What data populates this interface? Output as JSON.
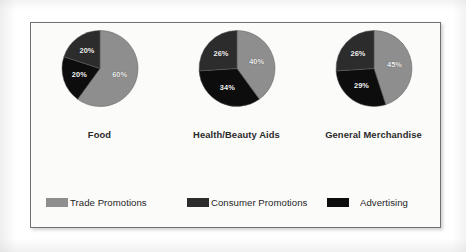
{
  "colors": {
    "trade_promotions": "#8e8e8e",
    "consumer_promotions": "#2c2c2c",
    "advertising": "#0d0d0d",
    "panel_background": "#fbfbfa",
    "panel_border": "#6e7173",
    "label_text": "#f2f2f2",
    "category_text": "#2a2a2a",
    "legend_text": "#1f1f1f"
  },
  "legend": {
    "items": [
      {
        "label": "Trade Promotions",
        "swatch_name": "legend-swatch-trade-promotions",
        "color": "#8e8e8e"
      },
      {
        "label": "Consumer Promotions",
        "swatch_name": "legend-swatch-consumer-promotions",
        "color": "#2c2c2c"
      },
      {
        "label": "Advertising",
        "swatch_name": "legend-swatch-advertising",
        "color": "#0d0d0d"
      }
    ]
  },
  "chart_data": {
    "type": "pie",
    "title": "",
    "subtitle": "",
    "xlabel": "",
    "ylabel": "",
    "grid": false,
    "legend_position": "bottom",
    "series_names": [
      "Trade Promotions",
      "Consumer Promotions",
      "Advertising"
    ],
    "value_suffix": "%",
    "start_angle_deg": 0,
    "direction": "clockwise",
    "charts": [
      {
        "category": "Food",
        "slices": [
          {
            "name": "Trade Promotions",
            "value": 60,
            "label": "60%",
            "color": "#8e8e8e"
          },
          {
            "name": "Advertising",
            "value": 20,
            "label": "20%",
            "color": "#0d0d0d"
          },
          {
            "name": "Consumer Promotions",
            "value": 20,
            "label": "20%",
            "color": "#2c2c2c"
          }
        ]
      },
      {
        "category": "Health/Beauty Aids",
        "slices": [
          {
            "name": "Trade Promotions",
            "value": 40,
            "label": "40%",
            "color": "#8e8e8e"
          },
          {
            "name": "Advertising",
            "value": 34,
            "label": "34%",
            "color": "#0d0d0d"
          },
          {
            "name": "Consumer Promotions",
            "value": 26,
            "label": "26%",
            "color": "#2c2c2c"
          }
        ]
      },
      {
        "category": "General Merchandise",
        "slices": [
          {
            "name": "Trade Promotions",
            "value": 45,
            "label": "45%",
            "color": "#8e8e8e"
          },
          {
            "name": "Advertising",
            "value": 29,
            "label": "29%",
            "color": "#0d0d0d"
          },
          {
            "name": "Consumer Promotions",
            "value": 26,
            "label": "26%",
            "color": "#2c2c2c"
          }
        ]
      }
    ]
  }
}
